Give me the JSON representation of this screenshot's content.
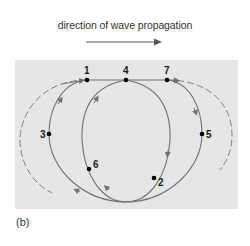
{
  "header": {
    "direction_label": "direction of wave propagation",
    "arrow_icon": "right-arrow"
  },
  "figure": {
    "caption": "(b)",
    "panel_color": "#e6e6e6",
    "curve_color": "#707070",
    "point_color": "#000000",
    "points": [
      {
        "label": "1",
        "x": 87,
        "y": 80
      },
      {
        "label": "2",
        "x": 154,
        "y": 178
      },
      {
        "label": "3",
        "x": 49,
        "y": 134
      },
      {
        "label": "4",
        "x": 126,
        "y": 80
      },
      {
        "label": "5",
        "x": 202,
        "y": 134
      },
      {
        "label": "6",
        "x": 89,
        "y": 169
      },
      {
        "label": "7",
        "x": 167,
        "y": 80
      }
    ]
  }
}
